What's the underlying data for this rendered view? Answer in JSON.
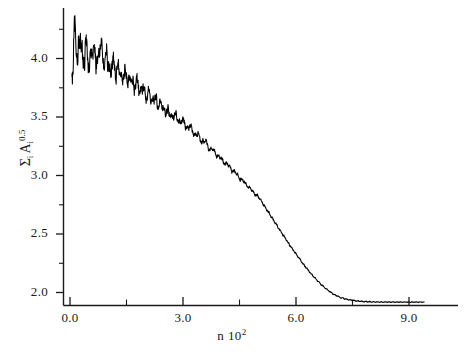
{
  "chart_data": {
    "type": "line",
    "title": "",
    "xlabel": "n 10^2",
    "xlabel_base": "n 10",
    "xlabel_exponent": "2",
    "ylabel": "Σ_i A_i^0.5",
    "ylabel_sigma": "Σ",
    "ylabel_sigma_sub": "i",
    "ylabel_var": "A",
    "ylabel_var_sub": "i",
    "ylabel_var_sup": "0.5",
    "xlim": [
      -0.35,
      10.2
    ],
    "ylim": [
      1.72,
      4.47
    ],
    "grid": false,
    "legend": null,
    "x_major_ticks": [
      0.0,
      3.0,
      6.0,
      9.0
    ],
    "x_major_tick_labels": [
      "0.0",
      "3.0",
      "6.0",
      "9.0"
    ],
    "x_minor_ticks": [
      1.5,
      4.5,
      7.5
    ],
    "y_major_ticks": [
      2.0,
      2.5,
      3.0,
      3.5,
      4.0
    ],
    "y_major_tick_labels": [
      "2.0",
      "2.5",
      "3.0",
      "3.5",
      "4.0"
    ],
    "y_minor_ticks": [
      2.25,
      2.75,
      3.25,
      3.75,
      4.25
    ],
    "series": [
      {
        "name": "sum of sqrt areas",
        "color": "#000000",
        "description": "Noisy monotonically decaying curve starting near 4.3 with strong fluctuations, decreasing smoothly and flattening to a plateau near 1.92 after n 10^2 = 7",
        "x": [
          0.05,
          0.12,
          0.2,
          0.28,
          0.35,
          0.42,
          0.5,
          0.58,
          0.66,
          0.74,
          0.82,
          0.9,
          0.98,
          1.06,
          1.14,
          1.22,
          1.3,
          1.38,
          1.46,
          1.54,
          1.62,
          1.7,
          1.78,
          1.86,
          1.94,
          2.02,
          2.1,
          2.18,
          2.26,
          2.34,
          2.42,
          2.5,
          2.6,
          2.7,
          2.8,
          2.9,
          3.0,
          3.1,
          3.2,
          3.3,
          3.4,
          3.5,
          3.6,
          3.7,
          3.8,
          3.9,
          4.0,
          4.1,
          4.2,
          4.3,
          4.4,
          4.5,
          4.6,
          4.7,
          4.8,
          4.9,
          5.0,
          5.2,
          5.4,
          5.6,
          5.8,
          6.0,
          6.2,
          6.4,
          6.6,
          6.8,
          7.0,
          7.2,
          7.4,
          7.6,
          7.8,
          8.0,
          8.3,
          8.6,
          8.9,
          9.2,
          9.4
        ],
        "y": [
          3.78,
          4.29,
          3.96,
          4.22,
          3.91,
          4.16,
          3.93,
          4.1,
          4.02,
          3.97,
          4.15,
          3.93,
          4.06,
          3.86,
          4.0,
          3.84,
          3.95,
          3.8,
          3.9,
          3.78,
          3.86,
          3.74,
          3.82,
          3.7,
          3.77,
          3.66,
          3.73,
          3.62,
          3.68,
          3.58,
          3.63,
          3.54,
          3.56,
          3.49,
          3.53,
          3.45,
          3.48,
          3.4,
          3.43,
          3.34,
          3.36,
          3.28,
          3.3,
          3.22,
          3.23,
          3.16,
          3.16,
          3.1,
          3.1,
          3.04,
          3.03,
          2.97,
          2.96,
          2.91,
          2.89,
          2.84,
          2.82,
          2.72,
          2.62,
          2.52,
          2.42,
          2.33,
          2.24,
          2.16,
          2.09,
          2.03,
          1.985,
          1.955,
          1.938,
          1.928,
          1.923,
          1.92,
          1.919,
          1.918,
          1.918,
          1.918,
          1.918
        ]
      }
    ]
  },
  "axes": {
    "y_labels": [
      "4.0",
      "3.5",
      "3.0",
      "2.5",
      "2.0"
    ],
    "x_labels": [
      "0.0",
      "3.0",
      "6.0",
      "9.0"
    ]
  }
}
